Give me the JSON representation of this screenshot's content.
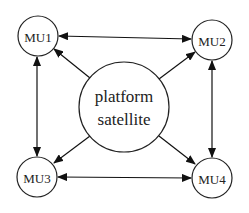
{
  "diagram": {
    "type": "network",
    "nodes": [
      {
        "id": "mu1",
        "label": "MU1",
        "cx": 38,
        "cy": 36,
        "r": 20
      },
      {
        "id": "mu2",
        "label": "MU2",
        "cx": 212,
        "cy": 40,
        "r": 20
      },
      {
        "id": "mu3",
        "label": "MU3",
        "cx": 37,
        "cy": 177,
        "r": 20
      },
      {
        "id": "mu4",
        "label": "MU4",
        "cx": 212,
        "cy": 178,
        "r": 20
      },
      {
        "id": "center",
        "label_line1": "platform",
        "label_line2": "satellite",
        "cx": 124,
        "cy": 107,
        "r": 45
      }
    ],
    "edges": [
      {
        "from": "mu1",
        "to": "mu2",
        "direction": "bidirectional"
      },
      {
        "from": "mu1",
        "to": "mu3",
        "direction": "bidirectional"
      },
      {
        "from": "mu2",
        "to": "mu4",
        "direction": "bidirectional"
      },
      {
        "from": "mu3",
        "to": "mu4",
        "direction": "bidirectional"
      },
      {
        "from": "center",
        "to": "mu1",
        "direction": "directed"
      },
      {
        "from": "center",
        "to": "mu2",
        "direction": "directed"
      },
      {
        "from": "center",
        "to": "mu3",
        "direction": "directed"
      },
      {
        "from": "center",
        "to": "mu4",
        "direction": "directed"
      }
    ],
    "colors": {
      "stroke": "#222222",
      "background": "#ffffff"
    }
  },
  "labels": {
    "mu1": "MU1",
    "mu2": "MU2",
    "mu3": "MU3",
    "mu4": "MU4",
    "center_line1": "platform",
    "center_line2": "satellite"
  }
}
